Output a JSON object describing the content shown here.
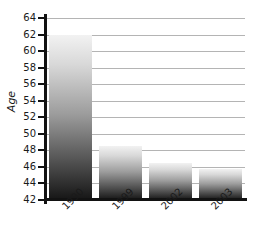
{
  "chart_data": {
    "type": "bar",
    "title": "",
    "xlabel": "",
    "ylabel": "Age",
    "categories": [
      "1990",
      "1999",
      "2002",
      "2003"
    ],
    "values": [
      62,
      48.5,
      46.5,
      45.8
    ],
    "ylim": [
      42,
      64
    ],
    "yticks": [
      42,
      44,
      46,
      48,
      50,
      52,
      54,
      56,
      58,
      60,
      62,
      64
    ],
    "ytick_labels": [
      "42",
      "44",
      "46",
      "48",
      "50",
      "52",
      "54",
      "56",
      "58",
      "60",
      "62",
      "64"
    ],
    "grid": true,
    "legend": false,
    "bar_style": "vertical-gradient-light-to-dark",
    "colors": {
      "gradient_top": "#f2f2f2",
      "gradient_bottom": "#151515",
      "gridline": "#b4b4b4",
      "axis": "#121212",
      "text": "#1a1a1a",
      "background": "#ffffff"
    }
  }
}
